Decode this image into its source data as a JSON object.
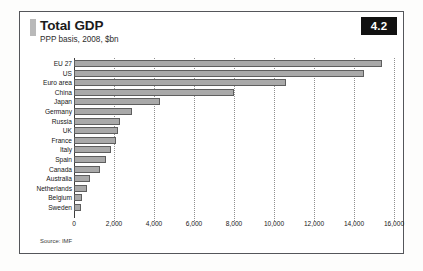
{
  "figure": {
    "number": "4.2",
    "title": "Total GDP",
    "subtitle": "PPP basis, 2008, $bn",
    "source": "Source: IMF"
  },
  "colors": {
    "bar_fill": "#a9a9a9",
    "bar_stroke": "#5e5e5e",
    "badge_background": "#111111",
    "badge_text": "#ffffff",
    "frame": "#54565a",
    "accent_tab": "#b9b9b9",
    "gridline": "#8f8f8f",
    "axis": "#3d3d3d"
  },
  "chart_data": {
    "type": "bar",
    "orientation": "horizontal",
    "title": "Total GDP",
    "subtitle": "PPP basis, 2008, $bn",
    "xlabel": "",
    "ylabel": "",
    "xlim": [
      0,
      16000
    ],
    "xticks": [
      0,
      2000,
      4000,
      6000,
      8000,
      10000,
      12000,
      14000,
      16000
    ],
    "xtick_labels": [
      "0",
      "2,000",
      "4,000",
      "6,000",
      "8,000",
      "10,000",
      "12,000",
      "14,000",
      "16,000"
    ],
    "grid": "vertical-dotted",
    "legend": "none",
    "categories": [
      "EU 27",
      "US",
      "Euro area",
      "China",
      "Japan",
      "Germany",
      "Russia",
      "UK",
      "France",
      "Italy",
      "Spain",
      "Canada",
      "Australia",
      "Netherlands",
      "Belgium",
      "Sweden"
    ],
    "values": [
      15400,
      14500,
      10600,
      8000,
      4300,
      2900,
      2300,
      2200,
      2100,
      1850,
      1600,
      1300,
      800,
      670,
      390,
      340
    ],
    "units": "$bn",
    "source": "Source: IMF"
  }
}
